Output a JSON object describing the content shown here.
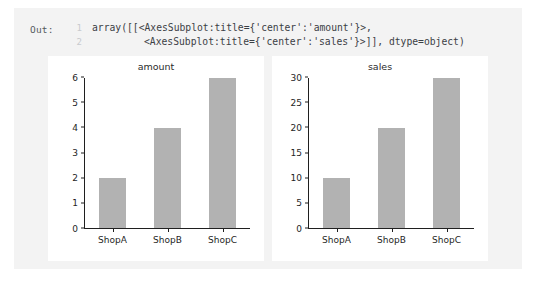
{
  "cell": {
    "prompt_label": "Out:",
    "repr_lines": [
      {
        "number": "1",
        "text": "array([[<AxesSubplot:title={'center':'amount'}>,"
      },
      {
        "number": "2",
        "text": "<AxesSubplot:title={'center':'sales'}>]], dtype=object)"
      }
    ]
  },
  "colors": {
    "bar": "#b2b2b2",
    "panel": "#f3f3f3",
    "figure": "#ffffff",
    "axis": "#1f1f1f",
    "gutter": "#c8cace"
  },
  "chart_data": [
    {
      "type": "bar",
      "title": "amount",
      "categories": [
        "ShopA",
        "ShopB",
        "ShopC"
      ],
      "values": [
        2,
        4,
        6
      ],
      "xlabel": "",
      "ylabel": "",
      "ylim": [
        0,
        6
      ],
      "yticks": [
        0,
        1,
        2,
        3,
        4,
        5,
        6
      ],
      "ytick_labels": [
        "0",
        "1",
        "2",
        "3",
        "4",
        "5",
        "6"
      ],
      "grid": false,
      "legend": null
    },
    {
      "type": "bar",
      "title": "sales",
      "categories": [
        "ShopA",
        "ShopB",
        "ShopC"
      ],
      "values": [
        10,
        20,
        30
      ],
      "xlabel": "",
      "ylabel": "",
      "ylim": [
        0,
        30
      ],
      "yticks": [
        0,
        5,
        10,
        15,
        20,
        25,
        30
      ],
      "ytick_labels": [
        "0",
        "5",
        "10",
        "15",
        "20",
        "25",
        "30"
      ],
      "grid": false,
      "legend": null
    }
  ]
}
